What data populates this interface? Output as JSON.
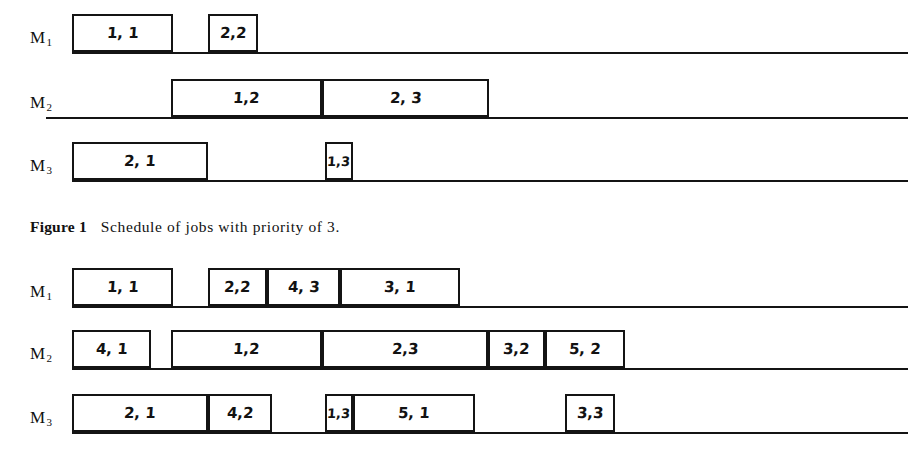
{
  "page": {
    "background": "#ffffff",
    "ink": "#141414",
    "width": 917,
    "height": 467
  },
  "figures": [
    {
      "id": "figure-1",
      "caption": {
        "title": "Figure 1",
        "text": "Schedule of jobs with priority of 3."
      },
      "rows": [
        {
          "machine": "M",
          "machine_sub": "1",
          "axis": {
            "x": 72,
            "width": 836
          },
          "boxes": [
            {
              "label": "1, 1",
              "x": 72,
              "width": 101
            },
            {
              "label": "2,2",
              "x": 208,
              "width": 50
            }
          ]
        },
        {
          "machine": "M",
          "machine_sub": "2",
          "axis": {
            "x": 46,
            "width": 862
          },
          "boxes": [
            {
              "label": "1,2",
              "x": 171,
              "width": 151
            },
            {
              "label": "2, 3",
              "x": 322,
              "width": 167
            }
          ]
        },
        {
          "machine": "M",
          "machine_sub": "3",
          "axis": {
            "x": 72,
            "width": 836
          },
          "boxes": [
            {
              "label": "2, 1",
              "x": 72,
              "width": 136
            },
            {
              "label": "1,3",
              "x": 325,
              "width": 28
            }
          ]
        }
      ]
    },
    {
      "id": "figure-2",
      "caption": null,
      "rows": [
        {
          "machine": "M",
          "machine_sub": "1",
          "axis": {
            "x": 72,
            "width": 836
          },
          "boxes": [
            {
              "label": "1, 1",
              "x": 72,
              "width": 101
            },
            {
              "label": "2,2",
              "x": 208,
              "width": 59
            },
            {
              "label": "4, 3",
              "x": 267,
              "width": 73
            },
            {
              "label": "3, 1",
              "x": 340,
              "width": 120
            }
          ]
        },
        {
          "machine": "M",
          "machine_sub": "2",
          "axis": {
            "x": 72,
            "width": 836
          },
          "boxes": [
            {
              "label": "4, 1",
              "x": 72,
              "width": 79
            },
            {
              "label": "1,2",
              "x": 171,
              "width": 151
            },
            {
              "label": "2,3",
              "x": 322,
              "width": 166
            },
            {
              "label": "3,2",
              "x": 488,
              "width": 57
            },
            {
              "label": "5, 2",
              "x": 545,
              "width": 80
            }
          ]
        },
        {
          "machine": "M",
          "machine_sub": "3",
          "axis": {
            "x": 72,
            "width": 836
          },
          "boxes": [
            {
              "label": "2, 1",
              "x": 72,
              "width": 136
            },
            {
              "label": "4,2",
              "x": 208,
              "width": 64
            },
            {
              "label": "1,3",
              "x": 325,
              "width": 28
            },
            {
              "label": "5, 1",
              "x": 353,
              "width": 122
            },
            {
              "label": "3,3",
              "x": 565,
              "width": 50
            }
          ]
        }
      ]
    }
  ],
  "chart_data": {
    "type": "bar",
    "title": "Schedule of jobs with priority of 3.",
    "xlabel": "",
    "ylabel": "",
    "categories": [
      "M1",
      "M2",
      "M3"
    ],
    "series": [
      {
        "name": "Figure 1 schedule",
        "machines": [
          {
            "machine": "M1",
            "tasks": [
              {
                "job": 1,
                "operation": 1,
                "label": "1, 1",
                "start": 0,
                "end": 101
              },
              {
                "job": 2,
                "operation": 2,
                "label": "2,2",
                "start": 136,
                "end": 186
              }
            ]
          },
          {
            "machine": "M2",
            "tasks": [
              {
                "job": 1,
                "operation": 2,
                "label": "1,2",
                "start": 99,
                "end": 250
              },
              {
                "job": 2,
                "operation": 3,
                "label": "2, 3",
                "start": 250,
                "end": 417
              }
            ]
          },
          {
            "machine": "M3",
            "tasks": [
              {
                "job": 2,
                "operation": 1,
                "label": "2, 1",
                "start": 0,
                "end": 136
              },
              {
                "job": 1,
                "operation": 3,
                "label": "1,3",
                "start": 253,
                "end": 281
              }
            ]
          }
        ]
      },
      {
        "name": "Figure 2 schedule",
        "machines": [
          {
            "machine": "M1",
            "tasks": [
              {
                "job": 1,
                "operation": 1,
                "label": "1, 1",
                "start": 0,
                "end": 101
              },
              {
                "job": 2,
                "operation": 2,
                "label": "2,2",
                "start": 136,
                "end": 195
              },
              {
                "job": 4,
                "operation": 3,
                "label": "4, 3",
                "start": 195,
                "end": 268
              },
              {
                "job": 3,
                "operation": 1,
                "label": "3, 1",
                "start": 268,
                "end": 388
              }
            ]
          },
          {
            "machine": "M2",
            "tasks": [
              {
                "job": 4,
                "operation": 1,
                "label": "4, 1",
                "start": 0,
                "end": 79
              },
              {
                "job": 1,
                "operation": 2,
                "label": "1,2",
                "start": 99,
                "end": 250
              },
              {
                "job": 2,
                "operation": 3,
                "label": "2,3",
                "start": 250,
                "end": 416
              },
              {
                "job": 3,
                "operation": 2,
                "label": "3,2",
                "start": 416,
                "end": 473
              },
              {
                "job": 5,
                "operation": 2,
                "label": "5, 2",
                "start": 473,
                "end": 553
              }
            ]
          },
          {
            "machine": "M3",
            "tasks": [
              {
                "job": 2,
                "operation": 1,
                "label": "2, 1",
                "start": 0,
                "end": 136
              },
              {
                "job": 4,
                "operation": 2,
                "label": "4,2",
                "start": 136,
                "end": 200
              },
              {
                "job": 1,
                "operation": 3,
                "label": "1,3",
                "start": 253,
                "end": 281
              },
              {
                "job": 5,
                "operation": 1,
                "label": "5, 1",
                "start": 281,
                "end": 403
              },
              {
                "job": 3,
                "operation": 3,
                "label": "3,3",
                "start": 493,
                "end": 543
              }
            ]
          }
        ]
      }
    ]
  }
}
